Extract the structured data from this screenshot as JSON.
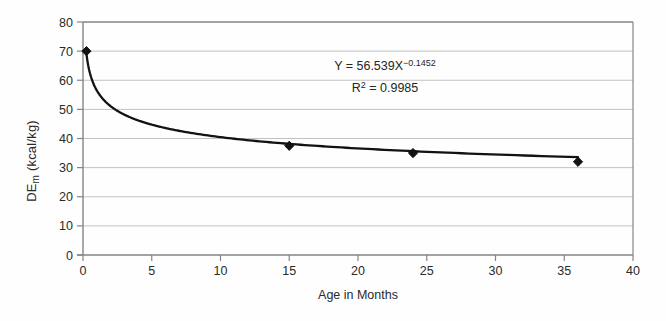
{
  "chart_data": {
    "type": "scatter",
    "title": "",
    "xlabel": "Age in Months",
    "ylabel_parts": {
      "base": "DE",
      "sub": "m",
      "rest": " (kcal/kg)"
    },
    "xlim": [
      0,
      40
    ],
    "ylim": [
      0,
      80
    ],
    "x_ticks": [
      0,
      5,
      10,
      15,
      20,
      25,
      30,
      35,
      40
    ],
    "y_ticks": [
      0,
      10,
      20,
      30,
      40,
      50,
      60,
      70,
      80
    ],
    "grid": "horizontal-only",
    "legend": "none",
    "points": [
      {
        "x": 0.25,
        "y": 70
      },
      {
        "x": 15,
        "y": 37.5
      },
      {
        "x": 24,
        "y": 35
      },
      {
        "x": 36,
        "y": 32
      }
    ],
    "trendline": {
      "type": "power",
      "a": 56.539,
      "b": -0.1452,
      "x_start": 0.25,
      "x_end": 36
    },
    "annotation": {
      "equation_base": "Y = 56.539X",
      "equation_exponent": "−0.1452",
      "r2_base": "R",
      "r2_sup": "2",
      "r2_rest": " = 0.9985"
    },
    "colors": {
      "curve": "#121212",
      "marker": "#121212",
      "grid": "#c2c2c2",
      "axis": "#858585",
      "text": "#2a2a2a",
      "background": "#fefefe"
    }
  }
}
